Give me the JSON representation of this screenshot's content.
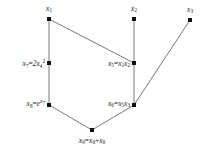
{
  "figure": {
    "type": "computational-graph",
    "background_color": "#ffffff",
    "node_color": "#111111",
    "edge_color": "#555555"
  },
  "nodes": [
    {
      "id": "x1",
      "label_html": "x<sub>1</sub>",
      "label_text": "x1",
      "x": 49,
      "y": 19,
      "label_x": 49,
      "label_y": 9,
      "anchor": "mid",
      "kind": "input"
    },
    {
      "id": "x2",
      "label_html": "x<sub>2</sub>",
      "label_text": "x2",
      "x": 134,
      "y": 19,
      "label_x": 134,
      "label_y": 9,
      "anchor": "mid",
      "kind": "input"
    },
    {
      "id": "x3",
      "label_html": "x<sub>3</sub>",
      "label_text": "x3",
      "x": 190,
      "y": 20,
      "label_x": 190,
      "label_y": 10,
      "anchor": "mid",
      "kind": "input"
    },
    {
      "id": "x7",
      "label_html": "x<sub>7</sub><span class=\"op\">=</span>2x<sub>4</sub><sup>2</sup>",
      "label_text": "x7=2x4^2",
      "x": 49,
      "y": 63,
      "label_x": 45,
      "label_y": 64,
      "anchor": "end",
      "kind": "computed"
    },
    {
      "id": "x5",
      "label_html": "x<sub>5</sub><span class=\"op\">=</span>x<sub>1</sub>x<sub>2</sub>",
      "label_text": "x5=x1x2",
      "x": 134,
      "y": 63,
      "label_x": 130,
      "label_y": 64,
      "anchor": "end",
      "kind": "computed"
    },
    {
      "id": "x8",
      "label_html": "x<sub>8</sub><span class=\"op\">=</span>e<sup class=\"var\">x<sub>7</sub></sup>",
      "label_text": "x8=e^x7",
      "x": 49,
      "y": 105,
      "label_x": 45,
      "label_y": 104,
      "anchor": "end",
      "kind": "computed"
    },
    {
      "id": "x6",
      "label_html": "x<sub>6</sub><span class=\"op\">=</span>x<sub>5</sub>x<sub>3</sub>",
      "label_text": "x6=x5x3",
      "x": 134,
      "y": 105,
      "label_x": 130,
      "label_y": 104,
      "anchor": "end",
      "kind": "computed"
    },
    {
      "id": "x9",
      "label_html": "x<sub>9</sub><span class=\"op\">=</span>x<sub>6</sub><span class=\"op\">+</span>x<sub>8</sub>",
      "label_text": "x9=x6+x8",
      "x": 92,
      "y": 130,
      "label_x": 92,
      "label_y": 141,
      "anchor": "mid",
      "kind": "output"
    }
  ],
  "edges": [
    {
      "from": "x1",
      "to": "x7",
      "x1": 49,
      "y1": 19,
      "x2": 49,
      "y2": 63
    },
    {
      "from": "x1",
      "to": "x5",
      "x1": 49,
      "y1": 19,
      "x2": 134,
      "y2": 63
    },
    {
      "from": "x2",
      "to": "x5",
      "x1": 134,
      "y1": 19,
      "x2": 134,
      "y2": 63
    },
    {
      "from": "x7",
      "to": "x8",
      "x1": 49,
      "y1": 63,
      "x2": 49,
      "y2": 105
    },
    {
      "from": "x5",
      "to": "x6",
      "x1": 134,
      "y1": 63,
      "x2": 134,
      "y2": 105
    },
    {
      "from": "x3",
      "to": "x6",
      "x1": 190,
      "y1": 20,
      "x2": 134,
      "y2": 105
    },
    {
      "from": "x8",
      "to": "x9",
      "x1": 49,
      "y1": 105,
      "x2": 92,
      "y2": 130
    },
    {
      "from": "x6",
      "to": "x9",
      "x1": 134,
      "y1": 105,
      "x2": 92,
      "y2": 130
    }
  ]
}
